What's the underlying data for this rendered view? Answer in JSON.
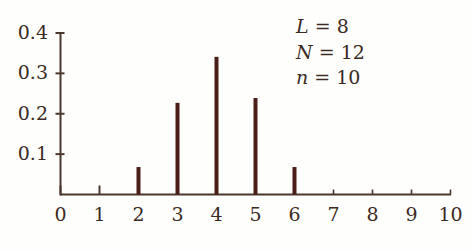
{
  "chart_data": {
    "type": "bar",
    "title": "",
    "subtitle": "",
    "xlabel": "",
    "ylabel": "",
    "categories": [
      0,
      1,
      2,
      3,
      4,
      5,
      6,
      7,
      8,
      9,
      10
    ],
    "values": [
      0,
      0,
      0.068,
      0.227,
      0.341,
      0.239,
      0.068,
      0,
      0,
      0,
      0
    ],
    "series": [
      {
        "name": "hypergeometric-pmf",
        "values": [
          0,
          0,
          0.068,
          0.227,
          0.341,
          0.239,
          0.068,
          0,
          0,
          0,
          0
        ]
      }
    ],
    "xlim": [
      0,
      10
    ],
    "ylim": [
      0,
      0.4
    ],
    "x_ticks": [
      "0",
      "1",
      "2",
      "3",
      "4",
      "5",
      "6",
      "7",
      "8",
      "9",
      "10"
    ],
    "x_tick_values": [
      0,
      1,
      2,
      3,
      4,
      5,
      6,
      7,
      8,
      9,
      10
    ],
    "y_ticks": [
      "0.1",
      "0.2",
      "0.3",
      "0.4"
    ],
    "y_tick_values": [
      0.1,
      0.2,
      0.3,
      0.4
    ],
    "grid": false,
    "legend": null,
    "bar_color": "#4a1f18",
    "axis_color": "#4a382e",
    "annotations": [
      {
        "symbol": "L",
        "eq": "=",
        "value": "8"
      },
      {
        "symbol": "N",
        "eq": "=",
        "value": "12"
      },
      {
        "symbol": "n",
        "eq": "=",
        "value": "10"
      }
    ]
  },
  "axes": {
    "y_tick_labels": [
      "0.4",
      "0.3",
      "0.2",
      "0.1"
    ],
    "x_tick_labels": [
      "0",
      "1",
      "2",
      "3",
      "4",
      "5",
      "6",
      "7",
      "8",
      "9",
      "10"
    ]
  },
  "annotation_lines": [
    {
      "text": "L = 8",
      "symbol": "L",
      "eq": "=",
      "value": "8"
    },
    {
      "text": "N = 12",
      "symbol": "N",
      "eq": "=",
      "value": "12"
    },
    {
      "text": "n = 10",
      "symbol": "n",
      "eq": "=",
      "value": "10"
    }
  ]
}
